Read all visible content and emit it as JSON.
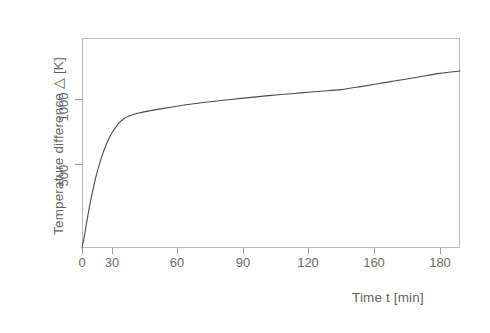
{
  "chart_data": {
    "type": "line",
    "title": "",
    "subtitle": "",
    "xlabel": "Time t [min]",
    "ylabel": "Temperature difference △  [K]",
    "xlim": [
      0,
      190
    ],
    "ylim": [
      0,
      1270
    ],
    "grid": false,
    "legend": null,
    "xticks": [
      0,
      30,
      60,
      90,
      120,
      160,
      180
    ],
    "xtick_labels": [
      "0",
      "30",
      "60",
      "90",
      "120",
      "160",
      "180"
    ],
    "yticks": [
      500,
      1000
    ],
    "ytick_labels": [
      "500",
      "1000"
    ],
    "series": [
      {
        "name": "Temperature difference",
        "x": [
          0,
          1,
          2,
          3,
          4,
          5,
          7,
          9,
          11,
          13,
          15,
          18,
          21,
          24,
          27,
          30,
          35,
          40,
          50,
          60,
          70,
          80,
          90,
          100,
          110,
          120,
          130,
          140,
          150,
          160,
          170,
          180,
          190
        ],
        "y": [
          0,
          60,
          130,
          200,
          265,
          325,
          430,
          518,
          590,
          648,
          695,
          748,
          782,
          800,
          812,
          820,
          832,
          843,
          862,
          878,
          892,
          905,
          917,
          928,
          938,
          948,
          958,
          976,
          996,
          1016,
          1036,
          1056,
          1070
        ]
      }
    ]
  },
  "axes": {
    "y_label_text": "Temperature difference △  [K]",
    "x_label_text": "Time t [min]",
    "y_tick_500": "500",
    "y_tick_1000": "1000",
    "x_tick_0": "0",
    "x_tick_30": "30",
    "x_tick_60": "60",
    "x_tick_90": "90",
    "x_tick_120": "120",
    "x_tick_160": "160",
    "x_tick_180": "180"
  },
  "colors": {
    "curve": "#4a4a4a",
    "frame": "#b9b9b9",
    "text": "#6b6b6b",
    "background": "#ffffff"
  }
}
